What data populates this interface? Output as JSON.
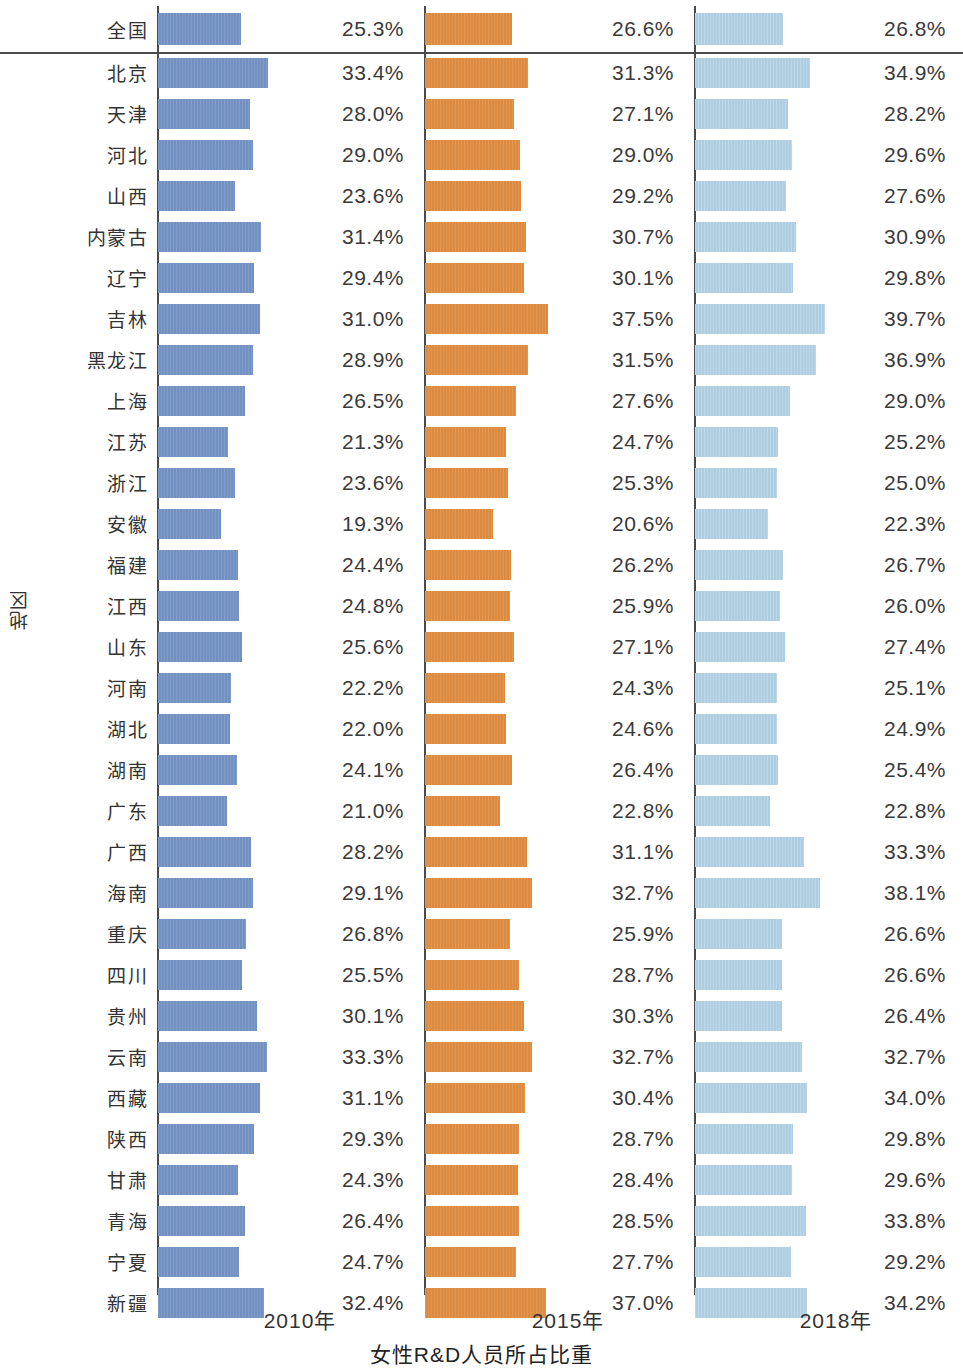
{
  "axes": {
    "y_title": "地区",
    "x_title": "女性R&D人员所占比重",
    "x_ticks": [
      "2010年",
      "2015年",
      "2018年"
    ]
  },
  "colors": {
    "y2010": "#7390c2",
    "y2015": "#dd8a3f",
    "y2018": "#aecde0",
    "axis": "#4a4a4a",
    "text": "#333333"
  },
  "chart_data": {
    "type": "bar",
    "orientation": "horizontal",
    "title": "女性R&D人员所占比重",
    "xlabel": "女性R&D人员所占比重",
    "ylabel": "地区",
    "grid": false,
    "legend_position": "none",
    "panel_tick_labels": [
      "2010年",
      "2015年",
      "2018年"
    ],
    "value_suffix": "%",
    "xlim": [
      0,
      42
    ],
    "categories": [
      "全国",
      "北京",
      "天津",
      "河北",
      "山西",
      "内蒙古",
      "辽宁",
      "吉林",
      "黑龙江",
      "上海",
      "江苏",
      "浙江",
      "安徽",
      "福建",
      "江西",
      "山东",
      "河南",
      "湖北",
      "湖南",
      "广东",
      "广西",
      "海南",
      "重庆",
      "四川",
      "贵州",
      "云南",
      "西藏",
      "陕西",
      "甘肃",
      "青海",
      "宁夏",
      "新疆"
    ],
    "series": [
      {
        "name": "2010年",
        "color": "#7390c2",
        "values": [
          25.3,
          33.4,
          28.0,
          29.0,
          23.6,
          31.4,
          29.4,
          31.0,
          28.9,
          26.5,
          21.3,
          23.6,
          19.3,
          24.4,
          24.8,
          25.6,
          22.2,
          22.0,
          24.1,
          21.0,
          28.2,
          29.1,
          26.8,
          25.5,
          30.1,
          33.3,
          31.1,
          29.3,
          24.3,
          26.4,
          24.7,
          32.4
        ],
        "labels": [
          "25.3%",
          "33.4%",
          "28.0%",
          "29.0%",
          "23.6%",
          "31.4%",
          "29.4%",
          "31.0%",
          "28.9%",
          "26.5%",
          "21.3%",
          "23.6%",
          "19.3%",
          "24.4%",
          "24.8%",
          "25.6%",
          "22.2%",
          "22.0%",
          "24.1%",
          "21.0%",
          "28.2%",
          "29.1%",
          "26.8%",
          "25.5%",
          "30.1%",
          "33.3%",
          "31.1%",
          "29.3%",
          "24.3%",
          "26.4%",
          "24.7%",
          "32.4%"
        ]
      },
      {
        "name": "2015年",
        "color": "#dd8a3f",
        "values": [
          26.6,
          31.3,
          27.1,
          29.0,
          29.2,
          30.7,
          30.1,
          37.5,
          31.5,
          27.6,
          24.7,
          25.3,
          20.6,
          26.2,
          25.9,
          27.1,
          24.3,
          24.6,
          26.4,
          22.8,
          31.1,
          32.7,
          25.9,
          28.7,
          30.3,
          32.7,
          30.4,
          28.7,
          28.4,
          28.5,
          27.7,
          37.0
        ],
        "labels": [
          "26.6%",
          "31.3%",
          "27.1%",
          "29.0%",
          "29.2%",
          "30.7%",
          "30.1%",
          "37.5%",
          "31.5%",
          "27.6%",
          "24.7%",
          "25.3%",
          "20.6%",
          "26.2%",
          "25.9%",
          "27.1%",
          "24.3%",
          "24.6%",
          "26.4%",
          "22.8%",
          "31.1%",
          "32.7%",
          "25.9%",
          "28.7%",
          "30.3%",
          "32.7%",
          "30.4%",
          "28.7%",
          "28.4%",
          "28.5%",
          "27.7%",
          "37.0%"
        ]
      },
      {
        "name": "2018年",
        "color": "#aecde0",
        "values": [
          26.8,
          34.9,
          28.2,
          29.6,
          27.6,
          30.9,
          29.8,
          39.7,
          36.9,
          29.0,
          25.2,
          25.0,
          22.3,
          26.7,
          26.0,
          27.4,
          25.1,
          24.9,
          25.4,
          22.8,
          33.3,
          38.1,
          26.6,
          26.6,
          26.4,
          32.7,
          34.0,
          29.8,
          29.6,
          33.8,
          29.2,
          34.2
        ],
        "labels": [
          "26.8%",
          "34.9%",
          "28.2%",
          "29.6%",
          "27.6%",
          "30.9%",
          "29.8%",
          "39.7%",
          "36.9%",
          "29.0%",
          "25.2%",
          "25.0%",
          "22.3%",
          "26.7%",
          "26.0%",
          "27.4%",
          "25.1%",
          "24.9%",
          "25.4%",
          "22.8%",
          "33.3%",
          "38.1%",
          "26.6%",
          "26.6%",
          "26.4%",
          "32.7%",
          "34.0%",
          "29.8%",
          "29.6%",
          "33.8%",
          "29.2%",
          "34.2%"
        ]
      }
    ]
  }
}
